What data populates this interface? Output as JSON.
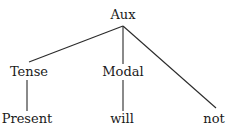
{
  "diagram": {
    "type": "syntax-tree",
    "root": {
      "label": "Aux",
      "children": [
        {
          "label": "Tense",
          "children": [
            {
              "label": "Present"
            }
          ]
        },
        {
          "label": "Modal",
          "children": [
            {
              "label": "will"
            }
          ]
        },
        {
          "label": "not"
        }
      ]
    },
    "nodes": {
      "aux": "Aux",
      "tense": "Tense",
      "modal": "Modal",
      "present": "Present",
      "will": "will",
      "not": "not"
    },
    "colors": {
      "line": "#2a2a2a",
      "text": "#1a1a1a",
      "background": "#ffffff"
    }
  }
}
